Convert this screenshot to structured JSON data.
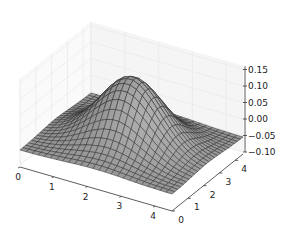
{
  "chart_data": {
    "type": "surface3d",
    "title": "",
    "x": {
      "label": "",
      "ticks": [
        "0",
        "1",
        "2",
        "3",
        "4"
      ],
      "range": [
        0,
        4.5
      ]
    },
    "y": {
      "label": "",
      "ticks": [
        "0",
        "1",
        "2",
        "3",
        "4"
      ],
      "range": [
        0,
        4.5
      ]
    },
    "z": {
      "label": "",
      "ticks": [
        "-0.10",
        "-0.05",
        "0.00",
        "0.05",
        "0.10",
        "0.15"
      ],
      "range": [
        -0.1,
        0.16
      ]
    },
    "peak": {
      "x": 2.25,
      "y": 2.25,
      "z": 0.145
    },
    "edge_value_approx": -0.05,
    "grid": true,
    "surface_color": "#808080",
    "edge_color": "#222222"
  }
}
